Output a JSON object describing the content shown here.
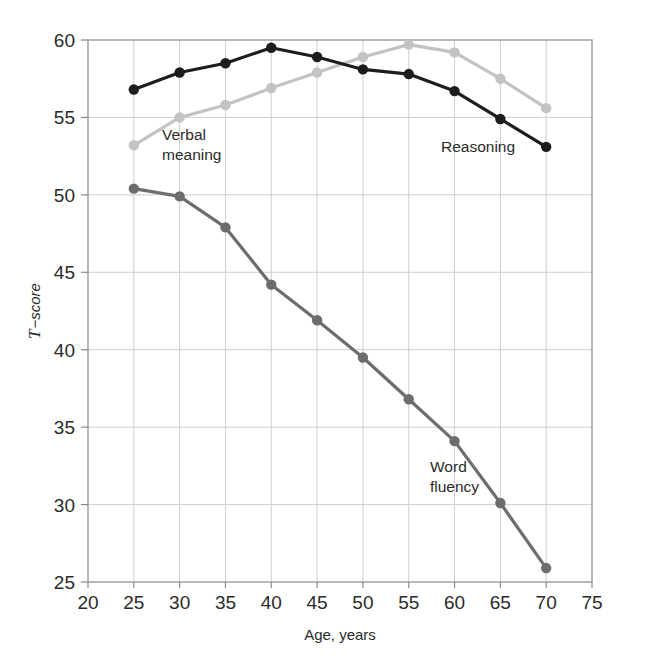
{
  "chart_data": {
    "type": "line",
    "title": "",
    "xlabel": "Age, years",
    "ylabel": "T−score",
    "ylabel_italic_prefix": "T",
    "ylabel_rest": "−score",
    "x": [
      25,
      30,
      35,
      40,
      45,
      50,
      55,
      60,
      65,
      70
    ],
    "xlim": [
      20,
      75
    ],
    "ylim": [
      25,
      60
    ],
    "xticks": [
      "20",
      "25",
      "30",
      "35",
      "40",
      "45",
      "50",
      "55",
      "60",
      "65",
      "70",
      "75"
    ],
    "xtick_values": [
      20,
      25,
      30,
      35,
      40,
      45,
      50,
      55,
      60,
      65,
      70,
      75
    ],
    "yticks": [
      "25",
      "30",
      "35",
      "40",
      "45",
      "50",
      "55",
      "60"
    ],
    "ytick_values": [
      25,
      30,
      35,
      40,
      45,
      50,
      55,
      60
    ],
    "grid": true,
    "legend": "inline-annotations",
    "series": [
      {
        "name": "Reasoning",
        "color": "#1d1d1d",
        "marker": "circle",
        "values": [
          56.8,
          57.9,
          58.5,
          59.5,
          58.9,
          58.1,
          57.8,
          56.7,
          54.9,
          53.1
        ],
        "annotation": {
          "label": "Reasoning",
          "lines": [
            "Reasoning"
          ],
          "x": 441,
          "y": 152
        }
      },
      {
        "name": "Verbal meaning",
        "color": "#c3c3c3",
        "marker": "circle",
        "values": [
          53.2,
          55.0,
          55.8,
          56.9,
          57.9,
          58.9,
          59.7,
          59.2,
          57.5,
          55.6
        ],
        "annotation": {
          "label": "Verbal meaning",
          "lines": [
            "Verbal",
            "meaning"
          ],
          "x": 162,
          "y": 140
        }
      },
      {
        "name": "Word fluency",
        "color": "#6d6d6d",
        "marker": "circle",
        "values": [
          50.4,
          49.9,
          47.9,
          44.2,
          41.9,
          39.5,
          36.8,
          34.1,
          30.1,
          25.9
        ],
        "annotation": {
          "label": "Word fluency",
          "lines": [
            "Word",
            "fluency"
          ],
          "x": 430,
          "y": 472
        }
      }
    ],
    "colors": {
      "reasoning": "#1d1d1d",
      "verbal_meaning": "#c3c3c3",
      "word_fluency": "#6d6d6d",
      "grid": "#cfcfcf",
      "axis": "#8a8a8a",
      "text": "#2b2b2b",
      "background": "#ffffff"
    }
  }
}
